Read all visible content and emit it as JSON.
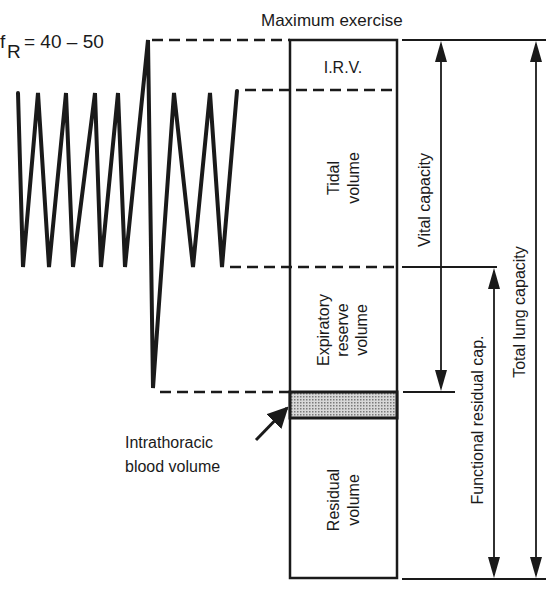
{
  "diagram": {
    "respiratory_rate_label": "f",
    "respiratory_rate_subscript": "R",
    "respiratory_rate_value": "= 40 – 50",
    "condition_label": "Maximum exercise",
    "compartments": {
      "irv": "I.R.V.",
      "tidal_line1": "Tidal",
      "tidal_line2": "volume",
      "erv_line1": "Expiratory",
      "erv_line2": "reserve",
      "erv_line3": "volume",
      "residual_line1": "Residual",
      "residual_line2": "volume"
    },
    "blood_volume_line1": "Intrathoracic",
    "blood_volume_line2": "blood volume",
    "capacities": {
      "vital": "Vital capacity",
      "functional_residual": "Functional residual cap.",
      "total_lung": "Total lung capacity"
    },
    "colors": {
      "ink": "#1a1a1a",
      "shade": "#b8b8b8"
    }
  }
}
